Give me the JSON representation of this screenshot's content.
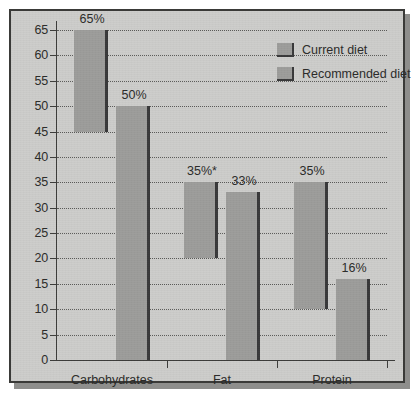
{
  "chart_data": {
    "type": "bar",
    "title": "",
    "subtitle": "",
    "xlabel": "",
    "ylabel": "",
    "categories": [
      "Carbohydrates",
      "Fat",
      "Protein"
    ],
    "ylim": [
      0,
      65
    ],
    "ytick_values": [
      0,
      5,
      10,
      15,
      20,
      25,
      30,
      35,
      40,
      45,
      50,
      55,
      60,
      65
    ],
    "ytick_labels": [
      "0",
      "5",
      "10",
      "15",
      "20",
      "25",
      "30",
      "35",
      "40",
      "45",
      "50",
      "55",
      "60",
      "65"
    ],
    "grid": true,
    "grid_style": "dotted-horizontal",
    "legend_position": "top-right",
    "series": [
      {
        "name": "Current diet",
        "color": "#9d9d9b",
        "values": [
          65,
          35,
          35
        ],
        "labels": [
          "65%",
          "35%*",
          "35%"
        ],
        "bar_bottoms": [
          45,
          20,
          10
        ],
        "note": "bars drawn truncated/floating, not starting at zero"
      },
      {
        "name": "Recommended diet",
        "color": "#9d9d9b",
        "values": [
          50,
          33,
          16
        ],
        "labels": [
          "50%",
          "33%",
          "16%"
        ],
        "bar_bottoms": [
          0,
          0,
          0
        ]
      }
    ],
    "annotations": [
      "*"
    ],
    "colors": {
      "panel_background": "#cdcdcb",
      "bar_fill": "#9d9d9b",
      "bar_edge": "#39393a",
      "axis": "#3d3d3b",
      "grid": "#5b5b59",
      "text": "#2b2b29",
      "border": "#3a3a38"
    }
  },
  "legend": {
    "items": [
      {
        "label": "Current diet"
      },
      {
        "label": "Recommended diet"
      }
    ]
  },
  "axis": {
    "y_labels": [
      "65",
      "60",
      "55",
      "50",
      "45",
      "40",
      "35",
      "30",
      "25",
      "20",
      "15",
      "10",
      "5",
      "0"
    ],
    "x_labels": [
      "Carbohydrates",
      "Fat",
      "Protein"
    ]
  },
  "bar_labels": [
    "65%",
    "50%",
    "35%*",
    "33%",
    "35%",
    "16%"
  ]
}
